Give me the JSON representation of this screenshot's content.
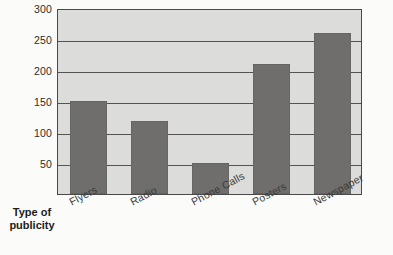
{
  "chart_data": {
    "type": "bar",
    "title": "",
    "xlabel": "Type of publicity",
    "ylabel": "",
    "categories": [
      "Flyers",
      "Radio",
      "Phone Calls",
      "Posters",
      "Newspaper"
    ],
    "values": [
      150,
      118,
      50,
      210,
      260
    ],
    "ylim": [
      0,
      300
    ],
    "yticks": [
      50,
      100,
      150,
      200,
      250,
      300
    ],
    "ytick_labels": [
      "50",
      "100",
      "150",
      "200",
      "250",
      "300"
    ],
    "grid": true,
    "legend": "none",
    "bar_color": "#6f6e6c",
    "plot_background": "#dcdcdb",
    "axis_color": "#4a4a48"
  },
  "axis_title": {
    "line1": "Type of",
    "line2": "publicity"
  }
}
